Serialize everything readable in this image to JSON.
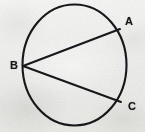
{
  "figure": {
    "kind": "geometry-diagram",
    "canvas": {
      "width": 145,
      "height": 132
    },
    "background_color": "#f2f2f1",
    "ink_color": "#17171a",
    "circle": {
      "name": "circle-outline",
      "center_x": 74.5,
      "center_y": 65,
      "radius_x": 52,
      "radius_y": 60.5,
      "stroke_width": 2.1
    },
    "points": [
      {
        "id": "A",
        "label": "A",
        "x": 120,
        "y": 29,
        "label_x": 129,
        "label_y": 22
      },
      {
        "id": "B",
        "label": "B",
        "x": 23,
        "y": 66,
        "label_x": 14,
        "label_y": 66
      },
      {
        "id": "C",
        "label": "C",
        "x": 121,
        "y": 102,
        "label_x": 132,
        "label_y": 107
      }
    ],
    "chords": [
      {
        "name": "chord-BA",
        "from": "B",
        "to": "A",
        "x1": 23,
        "y1": 66,
        "x2": 120,
        "y2": 29,
        "stroke_width": 2.0
      },
      {
        "name": "chord-BC",
        "from": "B",
        "to": "C",
        "x1": 23,
        "y1": 66,
        "x2": 121,
        "y2": 102,
        "stroke_width": 2.0
      }
    ],
    "labels": {
      "a": "A",
      "b": "B",
      "c": "C"
    }
  }
}
